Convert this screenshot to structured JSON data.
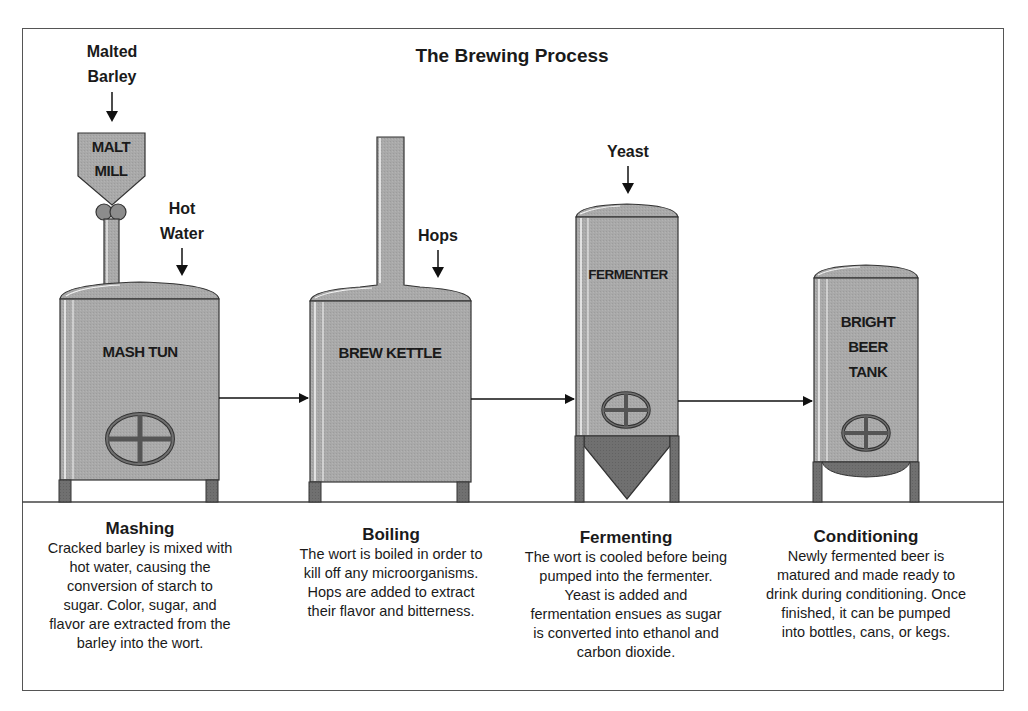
{
  "title": "The Brewing Process",
  "inputs": {
    "malted_barley": [
      "Malted",
      "Barley"
    ],
    "hot_water": [
      "Hot",
      "Water"
    ],
    "hops": "Hops",
    "yeast": "Yeast"
  },
  "equipment": {
    "malt_mill": [
      "MALT",
      "MILL"
    ],
    "mash_tun": "MASH TUN",
    "brew_kettle": "BREW KETTLE",
    "fermenter": "FERMENTER",
    "bright_beer_tank": [
      "BRIGHT",
      "BEER",
      "TANK"
    ]
  },
  "colors": {
    "tank_fill": "#a8a8a8",
    "tank_dark": "#6e6e6e",
    "leg_fill": "#5a5a5a",
    "outline": "#333333",
    "highlight": "#f4f4f4"
  },
  "steps": [
    {
      "heading": "Mashing",
      "text": "Cracked barley is mixed with\nhot water, causing the\nconversion of starch to\nsugar. Color, sugar, and\nflavor are extracted from the\nbarley into the wort."
    },
    {
      "heading": "Boiling",
      "text": "The wort is boiled in order to\nkill off any microorganisms.\nHops are added to extract\ntheir flavor and bitterness."
    },
    {
      "heading": "Fermenting",
      "text": "The wort is cooled before being\npumped into the fermenter.\nYeast is added and\nfermentation ensues as sugar\nis converted into ethanol and\ncarbon dioxide."
    },
    {
      "heading": "Conditioning",
      "text": "Newly fermented beer is\nmatured and made ready to\ndrink during conditioning. Once\nfinished, it can be pumped\ninto bottles, cans, or kegs."
    }
  ]
}
